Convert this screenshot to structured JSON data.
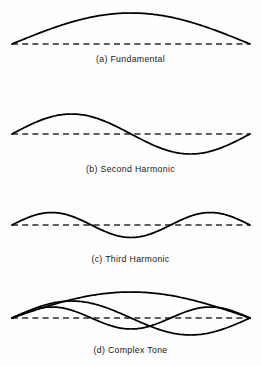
{
  "figure": {
    "background_color": "#fefefe",
    "curve_color": "#000000",
    "axis_color": "#2b2b2b",
    "width": 261,
    "height": 366
  },
  "chart_data": {
    "type": "line",
    "subtitle": "",
    "xlabel": "",
    "ylabel": "",
    "grid": false,
    "legend_position": "none",
    "x_range": [
      0,
      1
    ],
    "x_start_px": 12,
    "x_end_px": 250,
    "annotations": [
      "(a) Fundamental",
      "(b) Second Harmonic",
      "(c) Third Harmonic",
      "(d) Complex Tone"
    ],
    "panels": [
      {
        "id": "fundamental",
        "label": "(a) Fundamental",
        "baseline_y": 44,
        "caption_y": 54,
        "harmonic_number": 1,
        "cycles": 0.5,
        "amplitude_px": 31,
        "series": [
          {
            "name": "fundamental",
            "harmonic": 1,
            "amplitude": 31,
            "cycles": 0.5,
            "phase": 0
          }
        ]
      },
      {
        "id": "second-harmonic",
        "label": "(b) Second Harmonic",
        "baseline_y": 134,
        "caption_y": 164,
        "harmonic_number": 2,
        "cycles": 1.0,
        "amplitude_px": 20,
        "series": [
          {
            "name": "second-harmonic",
            "harmonic": 2,
            "amplitude": 20,
            "cycles": 1.0,
            "phase": 0
          }
        ]
      },
      {
        "id": "third-harmonic",
        "label": "(c) Third Harmonic",
        "baseline_y": 225,
        "caption_y": 254,
        "harmonic_number": 3,
        "cycles": 1.5,
        "amplitude_px": 12.5,
        "series": [
          {
            "name": "third-harmonic",
            "harmonic": 3,
            "amplitude": 12.5,
            "cycles": 1.5,
            "phase": 0
          }
        ]
      },
      {
        "id": "complex-tone",
        "label": "(d) Complex Tone",
        "baseline_y": 318,
        "caption_y": 345,
        "harmonic_number": 0,
        "cycles": 0,
        "amplitude_px": 26,
        "series": [
          {
            "name": "fundamental",
            "harmonic": 1,
            "amplitude": 26,
            "cycles": 0.5,
            "phase": 0
          },
          {
            "name": "second-harmonic",
            "harmonic": 2,
            "amplitude": 17,
            "cycles": 1.0,
            "phase": 0
          },
          {
            "name": "third-harmonic",
            "harmonic": 3,
            "amplitude": 11,
            "cycles": 1.5,
            "phase": 0
          }
        ]
      }
    ]
  },
  "captions": {
    "a": "(a) Fundamental",
    "b": "(b) Second Harmonic",
    "c": "(c) Third Harmonic",
    "d": "(d) Complex Tone"
  }
}
